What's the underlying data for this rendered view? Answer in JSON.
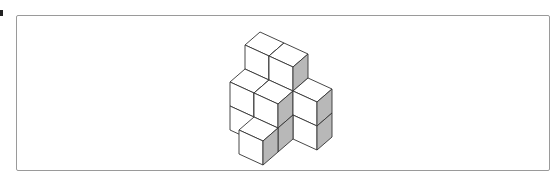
{
  "figure": {
    "type": "isometric cube stack",
    "cube_count": 9,
    "colors": {
      "face_light": "#ffffff",
      "face_shaded": "#b8b8b8",
      "edge": "#333333",
      "frame_border": "#9a9a9a"
    }
  }
}
